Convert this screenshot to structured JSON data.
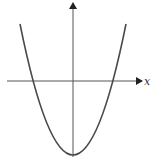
{
  "diagram": {
    "title": "",
    "x_axis_label": "x",
    "y_axis_label": "",
    "curve": {
      "type": "parabola",
      "opens": "up",
      "vertex_below_x_axis": true,
      "crosses_x_axis_twice": true
    },
    "colors": {
      "curve": "#4a4a4a",
      "axes": "#555555",
      "background": "#ffffff"
    }
  }
}
